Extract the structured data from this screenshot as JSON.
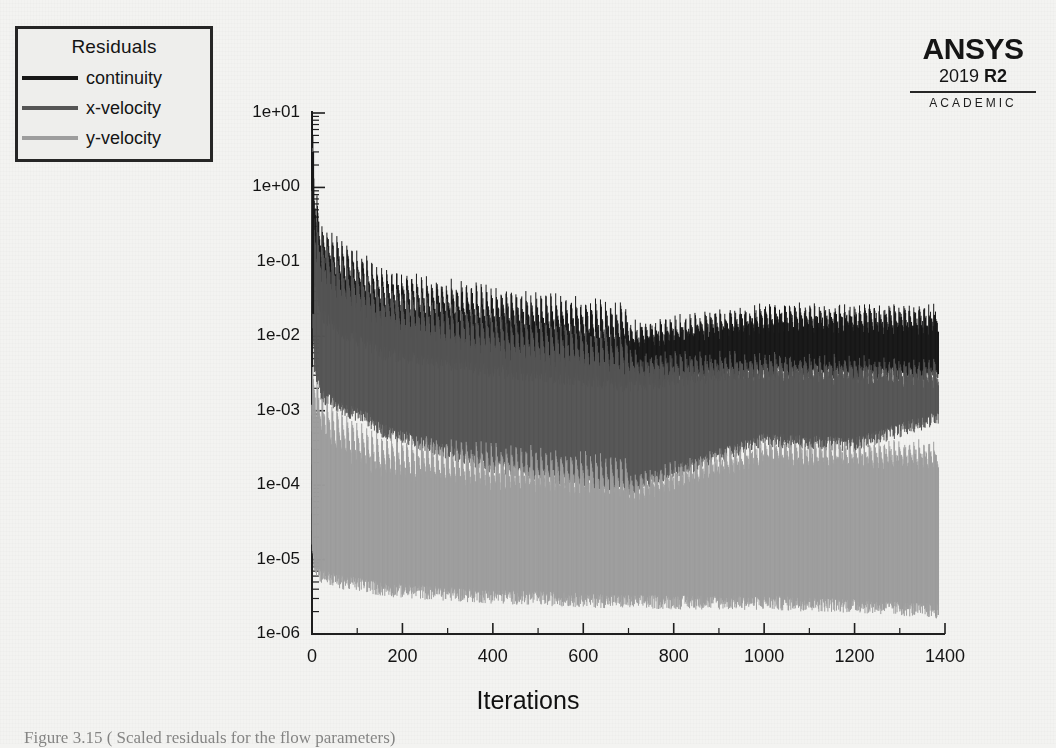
{
  "figure": {
    "background_color": "#f3f3f1",
    "caption": "Figure 3.15 ( Scaled residuals for the flow parameters)"
  },
  "legend": {
    "title": "Residuals",
    "position": "top-left",
    "items": [
      {
        "label": "continuity",
        "color": "#171717"
      },
      {
        "label": "x-velocity",
        "color": "#555555"
      },
      {
        "label": "y-velocity",
        "color": "#9d9d9d"
      }
    ]
  },
  "branding": {
    "name": "ANSYS",
    "release_year": "2019",
    "release_tag": "R2",
    "license": "ACADEMIC"
  },
  "axes": {
    "x_label": "Iterations",
    "y_label": "",
    "x_ticks": [
      "0",
      "200",
      "400",
      "600",
      "800",
      "1000",
      "1200",
      "1400"
    ],
    "y_ticks": [
      "1e+01",
      "1e+00",
      "1e-01",
      "1e-02",
      "1e-03",
      "1e-04",
      "1e-05",
      "1e-06"
    ],
    "grid": false,
    "spines": "left-bottom",
    "minor_ticks": true
  },
  "chart_data": {
    "type": "line",
    "title": "",
    "xlabel": "Iterations",
    "ylabel": "",
    "xlim": [
      0,
      1400
    ],
    "ylim": [
      1e-06,
      10
    ],
    "yscale": "log",
    "xticks": [
      0,
      200,
      400,
      600,
      800,
      1000,
      1200,
      1400
    ],
    "yticks": [
      10,
      1,
      0.1,
      0.01,
      0.001,
      0.0001,
      1e-05,
      1e-06
    ],
    "grid": false,
    "legend_position": "upper-left outside",
    "iterations_total": 1385,
    "series": [
      {
        "name": "continuity",
        "color": "#171717",
        "envelope_x": [
          1,
          5,
          20,
          60,
          120,
          150,
          250,
          390,
          500,
          700,
          1000,
          1200,
          1385
        ],
        "envelope_upper": [
          3.0,
          0.35,
          0.09,
          0.05,
          0.03,
          0.02,
          0.016,
          0.012,
          0.0095,
          0.0068,
          0.012,
          0.012,
          0.0115
        ],
        "envelope_lower": [
          0.9,
          0.06,
          0.02,
          0.012,
          0.008,
          0.006,
          0.005,
          0.0035,
          0.003,
          0.0022,
          0.0035,
          0.0032,
          0.003
        ],
        "final_value": 0.0031
      },
      {
        "name": "x-velocity",
        "color": "#555555",
        "envelope_x": [
          1,
          5,
          20,
          60,
          120,
          150,
          250,
          390,
          500,
          700,
          1000,
          1200,
          1385
        ],
        "envelope_upper": [
          0.9,
          0.12,
          0.055,
          0.03,
          0.018,
          0.013,
          0.009,
          0.0055,
          0.0042,
          0.0028,
          0.0026,
          0.0024,
          0.0022
        ],
        "envelope_lower": [
          0.02,
          0.004,
          0.0016,
          0.0011,
          0.0008,
          0.00055,
          0.00035,
          0.00018,
          0.00014,
          9e-05,
          0.0004,
          0.00035,
          0.0008
        ],
        "final_value": 0.0009
      },
      {
        "name": "y-velocity",
        "color": "#9d9d9d",
        "envelope_x": [
          1,
          5,
          20,
          60,
          120,
          150,
          250,
          390,
          500,
          700,
          1000,
          1200,
          1385
        ],
        "envelope_upper": [
          0.0012,
          0.0009,
          0.00045,
          0.00025,
          0.00016,
          0.00012,
          0.00011,
          9e-05,
          8e-05,
          6e-05,
          0.00019,
          0.00018,
          0.00017
        ],
        "envelope_lower": [
          1.6e-05,
          8e-06,
          6e-06,
          5e-06,
          4.5e-06,
          4e-06,
          3.6e-06,
          3.2e-06,
          3e-06,
          2.7e-06,
          2.6e-06,
          2.4e-06,
          2e-06
        ],
        "final_value": 1.8e-06
      }
    ]
  }
}
